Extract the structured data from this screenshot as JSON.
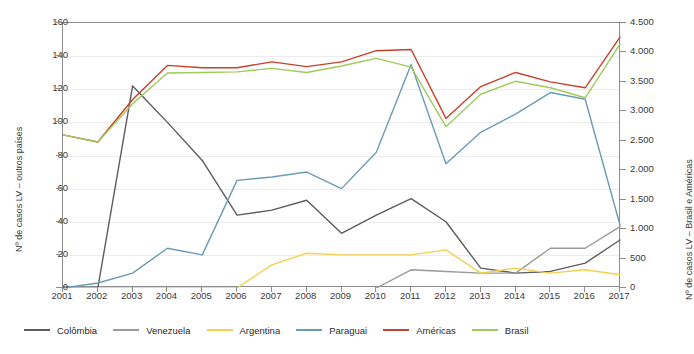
{
  "chart_data": {
    "type": "line",
    "title": "",
    "xlabel": "",
    "ylabel": "Nº de casos LV – outros países",
    "ylabel_right": "Nº de casos LV – Brasil e Américas",
    "grid": true,
    "legend_position": "bottom",
    "categories": [
      2001,
      2002,
      2003,
      2004,
      2005,
      2006,
      2007,
      2008,
      2009,
      2010,
      2011,
      2012,
      2013,
      2014,
      2015,
      2016,
      2017
    ],
    "x": [
      "2001",
      "2002",
      "2003",
      "2004",
      "2005",
      "2006",
      "2007",
      "2008",
      "2009",
      "2010",
      "2011",
      "2012",
      "2013",
      "2014",
      "2015",
      "2016",
      "2017"
    ],
    "ylim": [
      0,
      160
    ],
    "yticks": [
      0,
      20,
      40,
      60,
      80,
      100,
      120,
      140,
      160
    ],
    "ytick_labels": [
      "0",
      "20",
      "40",
      "60",
      "80",
      "100",
      "120",
      "140",
      "160"
    ],
    "ylim_right": [
      0,
      4500
    ],
    "yticks_right": [
      0,
      500,
      1000,
      1500,
      2000,
      2500,
      3000,
      3500,
      4000,
      4500
    ],
    "ytick_labels_right": [
      "0",
      "500",
      "1.000",
      "1.500",
      "2.000",
      "2.500",
      "3.000",
      "3.500",
      "4.000",
      "4.500"
    ],
    "series": [
      {
        "name": "Colômbia",
        "axis": "left",
        "color": "#5d5a60",
        "values": [
          0,
          0,
          122,
          100,
          77,
          44,
          47,
          53,
          33,
          44,
          54,
          40,
          12,
          9,
          10,
          15,
          29
        ]
      },
      {
        "name": "Venezuela",
        "axis": "left",
        "color": "#9a9a9a",
        "values": [
          null,
          null,
          null,
          null,
          null,
          null,
          null,
          null,
          null,
          0,
          11,
          10,
          9,
          9,
          24,
          24,
          37
        ]
      },
      {
        "name": "Argentina",
        "axis": "left",
        "color": "#f5d04f",
        "values": [
          0,
          0,
          0,
          0,
          0,
          0,
          14,
          21,
          20,
          20,
          20,
          23,
          9,
          12,
          9,
          11,
          8
        ]
      },
      {
        "name": "Paraguai",
        "axis": "left",
        "color": "#6a9bb5",
        "values": [
          0,
          3,
          9,
          24,
          20,
          65,
          67,
          70,
          60,
          82,
          135,
          75,
          94,
          105,
          118,
          114,
          38
        ]
      },
      {
        "name": "Américas",
        "axis": "right",
        "color": "#c8412b",
        "values": [
          2600,
          2480,
          3200,
          3780,
          3740,
          3740,
          3840,
          3760,
          3840,
          4030,
          4050,
          2880,
          3420,
          3660,
          3500,
          3400,
          4260
        ]
      },
      {
        "name": "Brasil",
        "axis": "right",
        "color": "#9ecb5a",
        "values": [
          2600,
          2480,
          3130,
          3650,
          3660,
          3670,
          3730,
          3660,
          3770,
          3900,
          3750,
          2740,
          3290,
          3510,
          3400,
          3230,
          4140
        ]
      }
    ]
  },
  "axes": {
    "left_title": "Nº de casos LV – outros países",
    "right_title": "Nº de casos LV – Brasil e Américas"
  }
}
